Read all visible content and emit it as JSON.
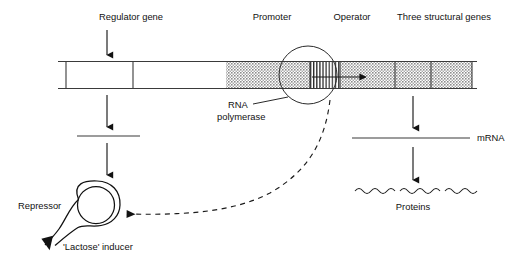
{
  "figure": {
    "background": "#ffffff",
    "ink": "#1a1a1a",
    "shade": "#b0b0b0"
  },
  "labels": {
    "regulator_gene": "Regulator gene",
    "promoter": "Promoter",
    "operator": "Operator",
    "structural_genes": "Three structural genes",
    "rna_line1": "RNA",
    "rna_line2": "polymerase",
    "mrna": "mRNA",
    "proteins": "Proteins",
    "repressor": "Repressor",
    "lactose_inducer": "'Lactose' inducer"
  },
  "dna_map": {
    "bar_left": 58,
    "bar_right": 477,
    "bar_top": 61,
    "bar_bottom": 89,
    "segments": [
      {
        "name": "regulator-gene-box",
        "x0": 66,
        "x1": 133,
        "fill": "white",
        "pattern": "none"
      },
      {
        "name": "spacer",
        "x0": 133,
        "x1": 226,
        "fill": "white",
        "pattern": "none"
      },
      {
        "name": "promoter",
        "x0": 226,
        "x1": 310,
        "fill": "shaded",
        "pattern": "stipple"
      },
      {
        "name": "operator",
        "x0": 310,
        "x1": 340,
        "fill": "white",
        "pattern": "vertical-stripes"
      },
      {
        "name": "structural-gene-1",
        "x0": 340,
        "x1": 395,
        "fill": "shaded",
        "pattern": "stipple"
      },
      {
        "name": "structural-gene-2",
        "x0": 395,
        "x1": 431,
        "fill": "shaded",
        "pattern": "stipple"
      },
      {
        "name": "structural-gene-3",
        "x0": 431,
        "x1": 472,
        "fill": "shaded",
        "pattern": "stipple"
      }
    ]
  },
  "annotations": {
    "polymerase_circle": {
      "cx": 308,
      "cy": 75,
      "r": 29
    },
    "transcription_arrow": {
      "x0": 312,
      "x1": 371,
      "y": 77
    }
  }
}
